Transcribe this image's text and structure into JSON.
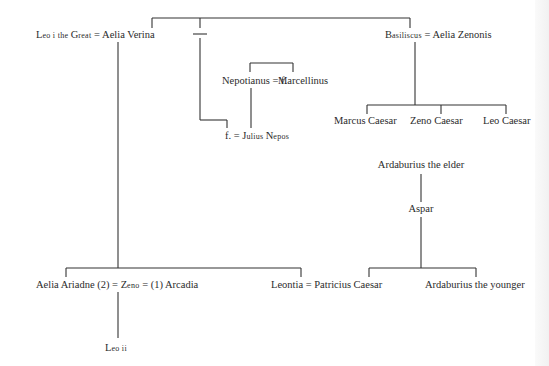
{
  "people": {
    "leo_i": {
      "name_first": "L",
      "name_rest": "eo i the ",
      "name_second": "G",
      "name_rest2": "reat"
    },
    "aelia_verina": "Aelia Verina",
    "basiliscus": {
      "first": "B",
      "rest": "asiliscus"
    },
    "aelia_zenonis": "Aelia Zenonis",
    "nepotianus": "Nepotianus",
    "f_daughter": "f.",
    "marcellinus": "Marcellinus",
    "julius_nepos_wife": "f.",
    "julius_nepos": {
      "first": "J",
      "rest": "ulius ",
      "second": "N",
      "rest2": "epos"
    },
    "marcus_caesar": "Marcus Caesar",
    "zeno_caesar": "Zeno Caesar",
    "leo_caesar": "Leo Caesar",
    "ardaburius_elder": "Ardaburius the elder",
    "aspar": "Aspar",
    "aelia_ariadne": "Aelia Ariadne",
    "ariadne_marker": "(2)",
    "zeno": {
      "first": "Z",
      "rest": "eno"
    },
    "arcadia_marker": "(1)",
    "arcadia": "Arcadia",
    "leontia": "Leontia",
    "patricius_caesar": "Patricius Caesar",
    "ardaburius_younger": "Ardaburius the younger",
    "leo_ii": {
      "first": "L",
      "rest": "eo ii"
    }
  },
  "symbols": {
    "marriage": "="
  }
}
